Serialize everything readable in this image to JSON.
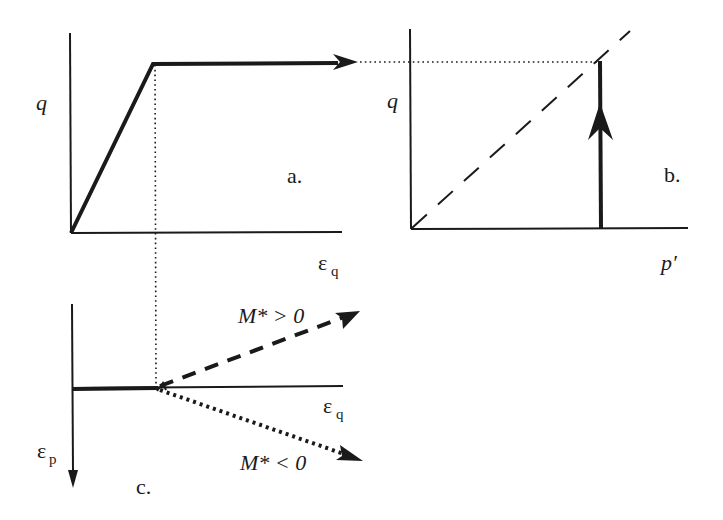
{
  "figure": {
    "colors": {
      "ink": "#1a1a1a",
      "background": "#ffffff"
    },
    "panel_a": {
      "label": "a.",
      "y_axis_label": "q",
      "x_axis_label_main": "ε",
      "x_axis_label_sub": "q",
      "path": "linear rise from origin then horizontal plateau with arrow"
    },
    "panel_b": {
      "label": "b.",
      "y_axis_label": "q",
      "x_axis_label": "p′",
      "path": "vertical stress path upward at constant p′ to dashed failure line"
    },
    "panel_c": {
      "label": "c.",
      "x_axis_label_main": "ε",
      "x_axis_label_sub": "q",
      "y_axis_label_main": "ε",
      "y_axis_label_sub": "p",
      "branch_upper_label": "M* > 0",
      "branch_lower_label": "M* < 0"
    }
  }
}
